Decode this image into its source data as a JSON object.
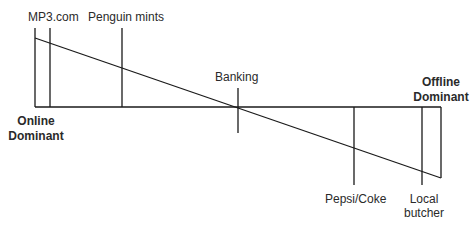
{
  "diagram": {
    "line_color": "#1a1a1a",
    "axis": {
      "left_label_line1": "Online",
      "left_label_line2": "Dominant",
      "right_label_line1": "Offline",
      "right_label_line2": "Dominant"
    },
    "markers": [
      {
        "label": "MP3.com",
        "position": "above"
      },
      {
        "label": "Penguin mints",
        "position": "above"
      },
      {
        "label": "Banking",
        "position": "above"
      },
      {
        "label": "Pepsi/Coke",
        "position": "below"
      },
      {
        "label_line1": "Local",
        "label_line2": "butcher",
        "position": "below"
      }
    ]
  }
}
